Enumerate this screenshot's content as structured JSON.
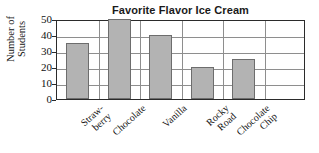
{
  "chart_data": {
    "type": "bar",
    "title": "Favorite Flavor Ice Cream",
    "xlabel": "",
    "ylabel": "Number of\nStudents",
    "categories": [
      "Straw-\nberry",
      "Chocolate",
      "Vanilla",
      "Rocky\nRoad",
      "Chocolate\nChip"
    ],
    "values": [
      35,
      50,
      40,
      20,
      25
    ],
    "ylim": [
      0,
      50
    ],
    "yticks": [
      0,
      10,
      20,
      30,
      40,
      50
    ],
    "ytick_labels": [
      "0",
      "10",
      "20",
      "30",
      "40",
      "50"
    ],
    "grid": true,
    "legend": false,
    "bar_color": "#b3b3b3",
    "bar_edge_color": "#6d6d6d",
    "axis_color": "#2b2b2b",
    "grid_color": "#8e8e8e",
    "text_color": "#111111",
    "slots": 6
  }
}
